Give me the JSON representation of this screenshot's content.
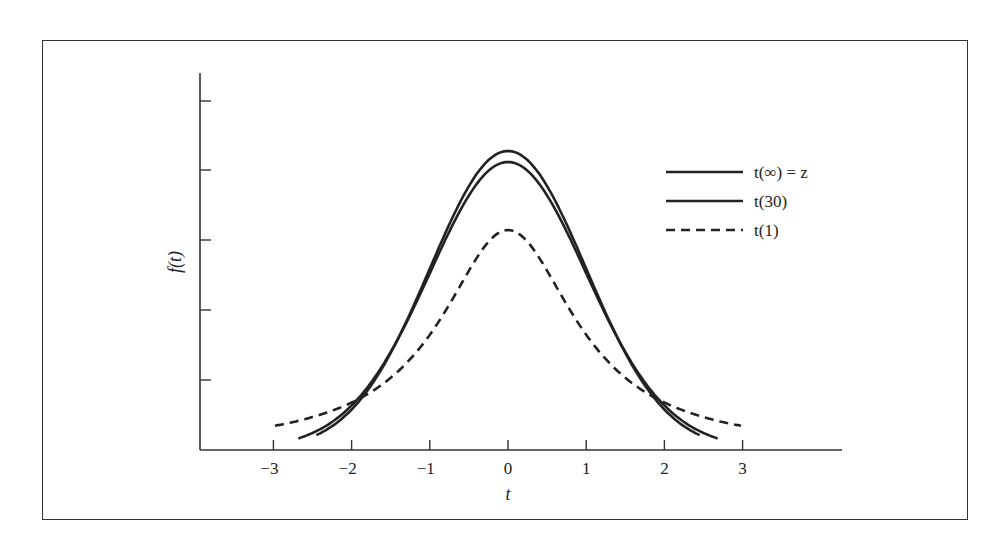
{
  "chart_data": {
    "type": "line",
    "title": "",
    "xlabel": "t",
    "ylabel": "f(t)",
    "xlim": [
      -3,
      3
    ],
    "x_ticks": [
      "−3",
      "−2",
      "−1",
      "0",
      "1",
      "2",
      "3"
    ],
    "y_ticks_labeled": false,
    "grid": false,
    "legend_position": "upper right",
    "series": [
      {
        "name": "t(∞) = z",
        "style": "solid",
        "description": "standard normal density",
        "peak": 0.399
      },
      {
        "name": "t(30)",
        "style": "solid",
        "description": "t distribution, 30 df",
        "peak": 0.396
      },
      {
        "name": "t(1)",
        "style": "dashed",
        "description": "t distribution, 1 df (Cauchy)",
        "peak": 0.318
      }
    ],
    "annotations": [
      "Curves cross near t ≈ ±2"
    ]
  },
  "legend": {
    "items": [
      {
        "label": "t(∞) = z",
        "style": "solid"
      },
      {
        "label": "t(30)",
        "style": "solid"
      },
      {
        "label": "t(1)",
        "style": "dashed"
      }
    ]
  },
  "axes": {
    "x_label": "t",
    "y_label": "f(t)",
    "x_tick_labels": [
      "−3",
      "−2",
      "−1",
      "0",
      "1",
      "2",
      "3"
    ]
  }
}
